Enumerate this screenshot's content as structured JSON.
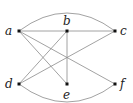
{
  "diagram": {
    "type": "graph",
    "vertices": [
      {
        "id": "a",
        "label": "a",
        "x": 19,
        "y": 31,
        "lx": 5,
        "ly": 35
      },
      {
        "id": "b",
        "label": "b",
        "x": 67,
        "y": 31,
        "lx": 63,
        "ly": 25
      },
      {
        "id": "c",
        "label": "c",
        "x": 115,
        "y": 31,
        "lx": 120,
        "ly": 35
      },
      {
        "id": "d",
        "label": "d",
        "x": 19,
        "y": 84,
        "lx": 5,
        "ly": 88
      },
      {
        "id": "e",
        "label": "e",
        "x": 67,
        "y": 84,
        "lx": 63,
        "ly": 99
      },
      {
        "id": "f",
        "label": "f",
        "x": 115,
        "y": 84,
        "lx": 120,
        "ly": 88
      }
    ],
    "edges": [
      {
        "from": "a",
        "to": "b",
        "shape": "line"
      },
      {
        "from": "b",
        "to": "c",
        "shape": "line"
      },
      {
        "from": "a",
        "to": "c",
        "shape": "arc-top"
      },
      {
        "from": "a",
        "to": "e",
        "shape": "line"
      },
      {
        "from": "a",
        "to": "f",
        "shape": "line"
      },
      {
        "from": "b",
        "to": "e",
        "shape": "line"
      },
      {
        "from": "b",
        "to": "d",
        "shape": "line"
      },
      {
        "from": "c",
        "to": "d",
        "shape": "line"
      },
      {
        "from": "d",
        "to": "f",
        "shape": "arc-bottom"
      }
    ]
  }
}
